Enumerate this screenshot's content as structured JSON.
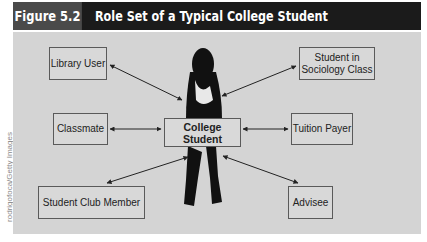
{
  "figure": {
    "number": "Figure 5.2",
    "title": "Role Set of a Typical College Student",
    "credit": "rodrigofoca/Getty Images",
    "colors": {
      "header_bg": "#1b1b1b",
      "figure_number_bg": "#4a4a4a",
      "panel_bg": "#d4d4d4",
      "box_border": "#5a5a5a",
      "arrow": "#222222",
      "silhouette": "#111111"
    }
  },
  "diagram": {
    "center": {
      "label_line1": "College",
      "label_line2": "Student"
    },
    "roles": [
      {
        "id": "library-user",
        "label": "Library User"
      },
      {
        "id": "sociology-student",
        "label_line1": "Student in",
        "label_line2": "Sociology Class"
      },
      {
        "id": "classmate",
        "label": "Classmate"
      },
      {
        "id": "tuition-payer",
        "label": "Tuition Payer"
      },
      {
        "id": "student-club-member",
        "label": "Student Club Member"
      },
      {
        "id": "advisee",
        "label": "Advisee"
      }
    ],
    "connections": [
      {
        "from": "College Student",
        "to": "Library User",
        "type": "bidirectional-arrow"
      },
      {
        "from": "College Student",
        "to": "Student in Sociology Class",
        "type": "bidirectional-arrow"
      },
      {
        "from": "College Student",
        "to": "Classmate",
        "type": "bidirectional-arrow"
      },
      {
        "from": "College Student",
        "to": "Tuition Payer",
        "type": "bidirectional-arrow"
      },
      {
        "from": "College Student",
        "to": "Student Club Member",
        "type": "bidirectional-arrow"
      },
      {
        "from": "College Student",
        "to": "Advisee",
        "type": "bidirectional-arrow"
      }
    ]
  }
}
